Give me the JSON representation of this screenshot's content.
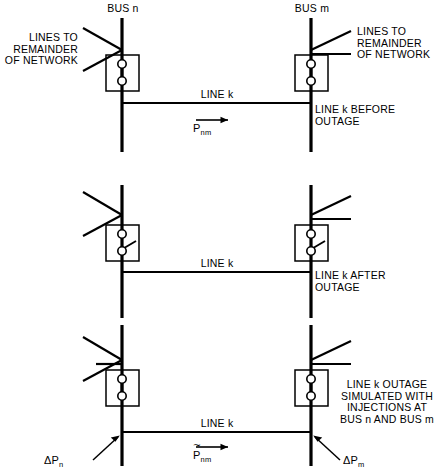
{
  "figure": {
    "stroke_color": "#000000",
    "background_color": "#ffffff"
  },
  "bus_labels": {
    "left": "BUS n",
    "right": "BUS m"
  },
  "network_labels": {
    "left": "LINES TO\nREMAINDER\nOF NETWORK",
    "right": "LINES TO\nREMAINDER\nOF NETWORK"
  },
  "panels": [
    {
      "id": "before-outage",
      "line_label": "LINE k",
      "caption": "LINE k BEFORE\nOUTAGE",
      "breaker_state": "closed",
      "flow": {
        "symbol": "P",
        "subscript": "nm",
        "tilde": false,
        "arrow": "right"
      }
    },
    {
      "id": "after-outage",
      "line_label": "LINE k",
      "caption": "LINE k AFTER\nOUTAGE",
      "breaker_state": "open",
      "flow": null
    },
    {
      "id": "simulated-outage",
      "line_label": "LINE k",
      "caption": "LINE k OUTAGE\nSIMULATED WITH\nINJECTIONS AT\nBUS n AND BUS m",
      "breaker_state": "closed",
      "flow": {
        "symbol": "P",
        "subscript": "nm",
        "tilde": true,
        "arrow": "right"
      },
      "injections": [
        {
          "symbol": "ΔP",
          "subscript": "n",
          "at_bus": "BUS n"
        },
        {
          "symbol": "ΔP",
          "subscript": "m",
          "at_bus": "BUS m"
        }
      ]
    }
  ]
}
